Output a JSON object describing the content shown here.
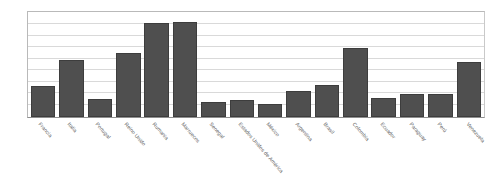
{
  "chart_data": {
    "type": "bar",
    "title": "",
    "subtitle": "",
    "xlabel": "",
    "ylabel": "",
    "ylim": [
      0,
      15000
    ],
    "grid": true,
    "legend": "none",
    "y_ticks": [
      {
        "value": 15000,
        "label": "15.000"
      },
      {
        "value": 13333,
        "label": "13.333"
      },
      {
        "value": 11667,
        "label": "11.667"
      },
      {
        "value": 10000,
        "label": "10.000"
      },
      {
        "value": 8333,
        "label": "8.333"
      },
      {
        "value": 6667,
        "label": "6.667"
      },
      {
        "value": 5000,
        "label": "5.000"
      },
      {
        "value": 3333,
        "label": "3.333"
      },
      {
        "value": 1667,
        "label": "1.667"
      },
      {
        "value": 0,
        "label": "0"
      }
    ],
    "categories": [
      "Francia",
      "Italia",
      "Portugal",
      "Reino Unido",
      "Rumania",
      "Marruecos",
      "Senegal",
      "Estados Unidos de América",
      "México",
      "Argentina",
      "Brasil",
      "Colombia",
      "Ecuador",
      "Paraguay",
      "Perú",
      "Venezuela"
    ],
    "values": [
      4500,
      8333,
      2571,
      9286,
      13714,
      13857,
      2143,
      2429,
      1857,
      3857,
      4714,
      10000,
      2714,
      3286,
      3286,
      8000
    ],
    "bar_color": "#4f4f4f",
    "grid_color": "#d9d9d9",
    "axis_color": "#8f8f8f",
    "text_color": "#5c5c5c",
    "background_color": "#ffffff"
  }
}
